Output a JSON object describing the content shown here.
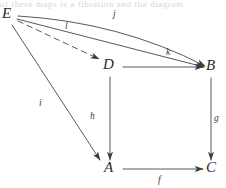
{
  "figure": {
    "type": "commutative-diagram",
    "caption_bleed": "of these maps is a fibration and the diagram",
    "colors": {
      "stroke": "#3a3a3a",
      "label": "#2b2b2b",
      "background": "#ffffff"
    }
  },
  "nodes": [
    {
      "id": "E",
      "label": "E",
      "x": 8,
      "y": 14
    },
    {
      "id": "D",
      "label": "D",
      "x": 110,
      "y": 65
    },
    {
      "id": "B",
      "label": "B",
      "x": 212,
      "y": 66
    },
    {
      "id": "A",
      "label": "A",
      "x": 110,
      "y": 168
    },
    {
      "id": "C",
      "label": "C",
      "x": 212,
      "y": 168
    }
  ],
  "edges": [
    {
      "id": "j",
      "label": "j",
      "from": "E",
      "to": "B",
      "style": "curved-solid",
      "label_x": 115,
      "label_y": 13
    },
    {
      "id": "l",
      "label": "l",
      "from": "E",
      "to": "D",
      "style": "dashed",
      "label_x": 66,
      "label_y": 24
    },
    {
      "id": "k",
      "label": "k",
      "from": "E",
      "to": "B",
      "style": "solid",
      "label_x": 167,
      "label_y": 50
    },
    {
      "id": "i",
      "label": "i",
      "from": "E",
      "to": "A",
      "style": "solid",
      "label_x": 40,
      "label_y": 101
    },
    {
      "id": "h",
      "label": "h",
      "from": "D",
      "to": "A",
      "style": "solid",
      "label_x": 91,
      "label_y": 114
    },
    {
      "id": "g",
      "label": "g",
      "from": "B",
      "to": "C",
      "style": "solid",
      "label_x": 214,
      "label_y": 116
    },
    {
      "id": "db",
      "label": "",
      "from": "D",
      "to": "B",
      "style": "solid",
      "label_x": 0,
      "label_y": 0
    },
    {
      "id": "f",
      "label": "f",
      "from": "A",
      "to": "C",
      "style": "solid",
      "label_x": 158,
      "label_y": 178
    }
  ]
}
